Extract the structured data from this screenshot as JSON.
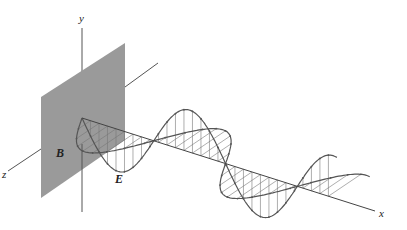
{
  "diagram": {
    "labels": {
      "y_axis": "y",
      "x_axis": "x",
      "z_axis": "z",
      "magnetic_field": "B",
      "electric_field": "E"
    },
    "colors": {
      "plane": "#9a9a9a",
      "axis": "#444444",
      "wave": "#555555",
      "hatch": "#777777"
    },
    "geometry": {
      "origin": [
        82,
        118
      ],
      "x_axis_end": [
        375,
        211
      ],
      "wavelength_t": 0.49,
      "t_end": 0.87,
      "e_amplitude": 42,
      "b_amplitude": 40
    }
  }
}
